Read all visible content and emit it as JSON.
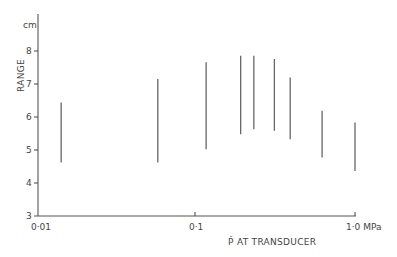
{
  "chart_data": {
    "type": "range",
    "title": "",
    "xlabel": "P̂ AT TRANSDUCER",
    "ylabel": "RANGE",
    "y_unit": "cm",
    "x_unit": "MPa",
    "x_scale": "log",
    "xlim": [
      0.01,
      1.0
    ],
    "ylim": [
      3,
      8.5
    ],
    "x_ticks": [
      "0·01",
      "0·1",
      "1·0 MPa"
    ],
    "y_ticks": [
      "3",
      "4",
      "5",
      "6",
      "7",
      "8"
    ],
    "grid": false,
    "series": [
      {
        "name": "range",
        "points": [
          {
            "x": 0.014,
            "low": 4.6,
            "high": 6.4
          },
          {
            "x": 0.057,
            "low": 4.6,
            "high": 7.1
          },
          {
            "x": 0.115,
            "low": 5.0,
            "high": 7.6
          },
          {
            "x": 0.19,
            "low": 5.45,
            "high": 7.8
          },
          {
            "x": 0.23,
            "low": 5.6,
            "high": 7.8
          },
          {
            "x": 0.31,
            "low": 5.55,
            "high": 7.7
          },
          {
            "x": 0.39,
            "low": 5.3,
            "high": 7.15
          },
          {
            "x": 0.62,
            "low": 4.75,
            "high": 6.15
          },
          {
            "x": 1.0,
            "low": 4.35,
            "high": 5.8
          }
        ]
      }
    ]
  },
  "labels": {
    "y_unit": "cm",
    "y_title": "RANGE",
    "x_title": "P̂ AT TRANSDUCER",
    "x0": "0·01",
    "x1": "0·1",
    "x2": "1·0 MPa",
    "y3": "3",
    "y4": "4",
    "y5": "5",
    "y6": "6",
    "y7": "7",
    "y8": "8"
  }
}
